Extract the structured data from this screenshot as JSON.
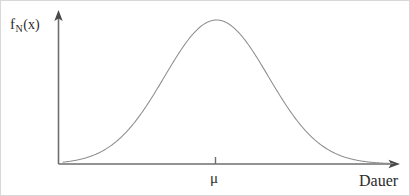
{
  "figure": {
    "background_color": "#ffffff",
    "border_color": "#d8d8d8",
    "width": 410,
    "height": 196
  },
  "axes": {
    "y_axis": {
      "name": "vertical-axis",
      "color": "#6e6e6e",
      "x": 57.5,
      "y_bottom": 163,
      "y_top": 14,
      "arrow_tip_y": 9,
      "stroke_width": 1.6
    },
    "x_axis": {
      "name": "horizontal-axis",
      "color": "#6e6e6e",
      "y": 163,
      "x_left": 57.5,
      "x_right": 392,
      "arrow_tip_x": 399,
      "stroke_width": 1.6
    },
    "tick": {
      "name": "mu-tick",
      "x": 214.5,
      "y_top": 156,
      "y_bottom": 163,
      "color": "#6e6e6e",
      "stroke_width": 1.4
    }
  },
  "labels": {
    "y_axis_label": {
      "base": "f",
      "subscript": "N",
      "argument": "(x)",
      "full": "fN(x)"
    },
    "x_axis_label": "Dauer",
    "mean_label": "μ"
  },
  "chart_data": {
    "type": "line",
    "title": "",
    "subtitle": "",
    "xlabel": "Dauer",
    "ylabel": "fN(x)",
    "grid": false,
    "legend": null,
    "legend_position": "none",
    "curve": {
      "name": "normal-distribution-density",
      "color": "#8d8d8d",
      "stroke_width": 1.05,
      "distribution": "normal",
      "mean_label": "μ",
      "mean_x_px": 215.5,
      "peak_y_px": 19,
      "baseline_y_px": 163,
      "sigma_px": 52,
      "visible_x_range_px": [
        62,
        392
      ],
      "annotations": [
        {
          "text": "μ",
          "x_px": 214.5,
          "y_px": 177,
          "note": "mean marked on horizontal axis"
        }
      ],
      "x_norm": [
        -3.0,
        -2.8,
        -2.6,
        -2.4,
        -2.2,
        -2.0,
        -1.8,
        -1.6,
        -1.4,
        -1.2,
        -1.0,
        -0.8,
        -0.6,
        -0.4,
        -0.2,
        0.0,
        0.2,
        0.4,
        0.6,
        0.8,
        1.0,
        1.2,
        1.4,
        1.6,
        1.8,
        2.0,
        2.2,
        2.4,
        2.6,
        2.8,
        3.0
      ],
      "y_norm": [
        0.0111,
        0.0198,
        0.034,
        0.0561,
        0.0889,
        0.1353,
        0.1979,
        0.278,
        0.3753,
        0.4868,
        0.6065,
        0.7261,
        0.8353,
        0.9231,
        0.9802,
        1.0,
        0.9802,
        0.9231,
        0.8353,
        0.7261,
        0.6065,
        0.4868,
        0.3753,
        0.278,
        0.1979,
        0.1353,
        0.0889,
        0.0561,
        0.034,
        0.0198,
        0.0111
      ]
    },
    "axis_ranges": {
      "x": "unlabeled continuous duration axis",
      "y": "unlabeled probability density axis"
    }
  }
}
